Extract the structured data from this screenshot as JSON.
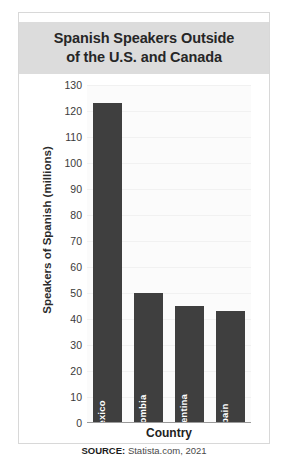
{
  "figure": {
    "title_line1": "Spanish Speakers Outside",
    "title_line2": "of the U.S. and Canada",
    "source_label": "SOURCE:",
    "source_value": "Statista.com, 2021"
  },
  "chart_data": {
    "type": "bar",
    "title": "Spanish Speakers Outside of the U.S. and Canada",
    "categories": [
      "Mexico",
      "Colombia",
      "Argentina",
      "Spain"
    ],
    "values": [
      123,
      50,
      45,
      43
    ],
    "xlabel": "Country",
    "ylabel": "Speakers of Spanish (millions)",
    "ylim": [
      0,
      130
    ],
    "ytick_step": 10,
    "yticks": [
      0,
      10,
      20,
      30,
      40,
      50,
      60,
      70,
      80,
      90,
      100,
      110,
      120,
      130
    ],
    "ytick_labels": [
      "0",
      "10",
      "20",
      "30",
      "40",
      "50",
      "60",
      "70",
      "80",
      "90",
      "100",
      "110",
      "120",
      "130"
    ],
    "grid": true,
    "legend": false,
    "bar_color": "#3f3f3f",
    "plot_background": "#fbfbfb",
    "title_background": "#dcdcdc"
  }
}
